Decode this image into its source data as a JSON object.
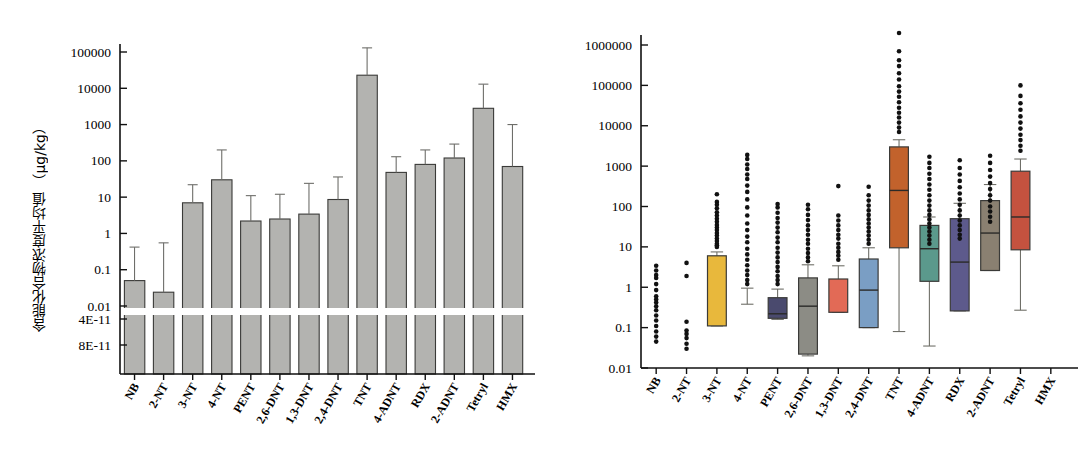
{
  "figure": {
    "categories": [
      "NB",
      "2-NT",
      "3-NT",
      "4-NT",
      "PENT",
      "2,6-DNT",
      "1,3-DNT",
      "2,4-DNT",
      "TNT",
      "4-ADNT",
      "RDX",
      "2-ADNT",
      "Tetryl",
      "HMX"
    ]
  },
  "chart_data": [
    {
      "type": "bar",
      "panel": "left",
      "title": "",
      "xlabel": "",
      "ylabel": "含能化合物浓度平均值 （μg/kg）",
      "yscale": "log",
      "ylim": [
        0.008,
        300000
      ],
      "axis_break": true,
      "break_note": "Axis broken below 0.01; extra ticks 4E-11 and 8E-11 shown beneath break",
      "ytick_labels": [
        "100000",
        "10000",
        "1000",
        "100",
        "10",
        "1",
        "0.1",
        "0.01",
        "4E-11",
        "8E-11"
      ],
      "ytick_values": [
        100000,
        10000,
        1000,
        100,
        10,
        1,
        0.1,
        0.01,
        4e-11,
        8e-11
      ],
      "grid": false,
      "legend": "none",
      "categories": [
        "NB",
        "2-NT",
        "3-NT",
        "4-NT",
        "PENT",
        "2,6-DNT",
        "1,3-DNT",
        "2,4-DNT",
        "TNT",
        "4-ADNT",
        "RDX",
        "2-ADNT",
        "Tetryl",
        "HMX"
      ],
      "values": [
        0.05,
        0.024,
        7.0,
        30.0,
        2.2,
        2.5,
        3.4,
        8.6,
        23000,
        48,
        80,
        120,
        2800,
        70
      ],
      "error_upper": [
        0.42,
        0.55,
        22,
        200,
        11,
        12,
        24,
        36,
        130000,
        130,
        200,
        290,
        13000,
        1000
      ],
      "bar_color": "#b3b3b0",
      "bar_edge_color": "#3a3a38",
      "error_color": "#6e6e6a"
    },
    {
      "type": "box",
      "panel": "right",
      "title": "",
      "xlabel": "",
      "ylabel": "含能化合物浓度分布 （μg/kg）",
      "yscale": "log",
      "ylim": [
        0.01,
        3000000
      ],
      "ytick_labels": [
        "1000000",
        "100000",
        "10000",
        "1000",
        "100",
        "10",
        "1",
        "0.1",
        "0.01"
      ],
      "ytick_values": [
        1000000,
        100000,
        10000,
        1000,
        100,
        10,
        1,
        0.1,
        0.01
      ],
      "grid": false,
      "legend": "none",
      "categories": [
        "NB",
        "2-NT",
        "3-NT",
        "4-NT",
        "PENT",
        "2,6-DNT",
        "1,3-DNT",
        "2,4-DNT",
        "TNT",
        "4-ADNT",
        "RDX",
        "2-ADNT",
        "Tetryl",
        "HMX"
      ],
      "boxes": [
        {
          "name": "NB",
          "color": null,
          "has_box": false,
          "q1": null,
          "median": null,
          "q3": null,
          "whisker_low": null,
          "whisker_high": null,
          "outliers": [
            3.4,
            2.6,
            2.0,
            1.7,
            1.2,
            0.85,
            0.6,
            0.5,
            0.42,
            0.34,
            0.27,
            0.2,
            0.15,
            0.11,
            0.08,
            0.06,
            0.045
          ]
        },
        {
          "name": "2-NT",
          "color": null,
          "has_box": false,
          "q1": null,
          "median": null,
          "q3": null,
          "whisker_low": null,
          "whisker_high": null,
          "outliers": [
            4.0,
            1.9,
            0.14,
            0.085,
            0.07,
            0.055,
            0.04,
            0.03
          ]
        },
        {
          "name": "3-NT",
          "color": "#e8b83c",
          "has_box": true,
          "q1": 0.11,
          "median": null,
          "q3": 6.0,
          "whisker_low": 0.11,
          "whisker_high": 7.5,
          "outliers": [
            200,
            130,
            110,
            90,
            72,
            60,
            50,
            42,
            35,
            30,
            26,
            22,
            19,
            16,
            14,
            12,
            11,
            10
          ]
        },
        {
          "name": "4-NT",
          "color": null,
          "has_box": false,
          "q1": null,
          "median": null,
          "q3": null,
          "whisker_low": 0.38,
          "whisker_high": 0.95,
          "outliers": [
            1900,
            1500,
            1100,
            850,
            620,
            480,
            330,
            230,
            150,
            95,
            60,
            38,
            26,
            18,
            13,
            9,
            6.5,
            4.8,
            3.5,
            2.6,
            2.0,
            1.5,
            1.2
          ]
        },
        {
          "name": "PENT",
          "color": "#4a4a6e",
          "has_box": true,
          "q1": 0.17,
          "median": 0.22,
          "q3": 0.55,
          "whisker_low": 0.16,
          "whisker_high": 0.9,
          "outliers": [
            115,
            95,
            70,
            52,
            40,
            30,
            23,
            17,
            13,
            9.5,
            7.2,
            5.5,
            4.2,
            3.2,
            2.5,
            1.9,
            1.5,
            1.2
          ]
        },
        {
          "name": "2,6-DNT",
          "color": "#8c8c85",
          "has_box": true,
          "q1": 0.022,
          "median": 0.34,
          "q3": 1.7,
          "whisker_low": 0.02,
          "whisker_high": 3.6,
          "outliers": [
            110,
            85,
            62,
            46,
            34,
            26,
            20,
            15,
            12,
            9,
            7,
            5.5,
            4.4
          ]
        },
        {
          "name": "1,3-DNT",
          "color": "#e26a56",
          "has_box": true,
          "q1": 0.24,
          "median": null,
          "q3": 1.6,
          "whisker_low": 0.24,
          "whisker_high": 3.4,
          "outliers": [
            320,
            60,
            45,
            34,
            26,
            20,
            16,
            12,
            9.5,
            7.5,
            6,
            4.8
          ]
        },
        {
          "name": "2,4-DNT",
          "color": "#7a9ec4",
          "has_box": true,
          "q1": 0.1,
          "median": 0.85,
          "q3": 5.0,
          "whisker_low": 0.1,
          "whisker_high": 9.5,
          "outliers": [
            310,
            190,
            140,
            105,
            80,
            62,
            48,
            38,
            30,
            24,
            19,
            15,
            12
          ]
        },
        {
          "name": "TNT",
          "color": "#c2622c",
          "has_box": true,
          "q1": 9.5,
          "median": 250,
          "q3": 3000,
          "whisker_low": 0.08,
          "whisker_high": 4500,
          "outliers": [
            2000000,
            700000,
            420000,
            300000,
            200000,
            140000,
            95000,
            70000,
            52000,
            38000,
            28000,
            21000,
            16000,
            12000,
            9000,
            7000
          ]
        },
        {
          "name": "4-ADNT",
          "color": "#5b998c",
          "has_box": true,
          "q1": 1.4,
          "median": 9.0,
          "q3": 34,
          "whisker_low": 0.035,
          "whisker_high": 55,
          "outliers": [
            1700,
            1200,
            900,
            650,
            480,
            350,
            260,
            190,
            140,
            105,
            80,
            62,
            48,
            38,
            30,
            24,
            19,
            15,
            12
          ]
        },
        {
          "name": "RDX",
          "color": "#5d5a8c",
          "has_box": true,
          "q1": 0.26,
          "median": 4.2,
          "q3": 50,
          "whisker_low": 0.26,
          "whisker_high": 120,
          "outliers": [
            1400,
            900,
            620,
            430,
            300,
            210,
            150,
            110,
            80,
            60,
            45,
            34,
            26,
            20,
            16
          ]
        },
        {
          "name": "2-ADNT",
          "color": "#8a8071",
          "has_box": true,
          "q1": 2.6,
          "median": 22,
          "q3": 140,
          "whisker_low": 2.6,
          "whisker_high": 350,
          "outliers": [
            1800,
            1200,
            800,
            550,
            380,
            270,
            190,
            140,
            100,
            75,
            56,
            42
          ]
        },
        {
          "name": "Tetryl",
          "color": "#c4523f",
          "has_box": true,
          "q1": 8.5,
          "median": 55,
          "q3": 750,
          "whisker_low": 0.27,
          "whisker_high": 1500,
          "outliers": [
            100000,
            55000,
            36000,
            25000,
            17000,
            12000,
            8500,
            6000,
            4400,
            3200,
            2400
          ]
        },
        {
          "name": "HMX",
          "color": null,
          "has_box": false,
          "q1": null,
          "median": null,
          "q3": null,
          "whisker_low": null,
          "whisker_high": null,
          "outliers": []
        }
      ]
    }
  ]
}
